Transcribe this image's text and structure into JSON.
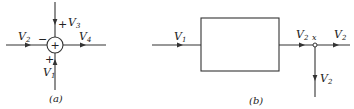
{
  "diagram_a": {
    "caption": "(a)",
    "junction_symbol": "+",
    "inputs": [
      {
        "name": "V",
        "sub": "2",
        "sign": "−",
        "direction": "from-left"
      },
      {
        "name": "V",
        "sub": "3",
        "sign": "+",
        "direction": "from-top"
      },
      {
        "name": "V",
        "sub": "1",
        "sign": "+",
        "direction": "from-bottom"
      }
    ],
    "output": {
      "name": "V",
      "sub": "4",
      "direction": "to-right"
    }
  },
  "diagram_b": {
    "caption": "(b)",
    "input": {
      "name": "V",
      "sub": "1"
    },
    "block_label": "",
    "output": {
      "name": "V",
      "sub": "2"
    },
    "takeoff_point": "x",
    "branches": [
      {
        "name": "V",
        "sub": "2",
        "direction": "right"
      },
      {
        "name": "V",
        "sub": "2",
        "direction": "down"
      }
    ]
  },
  "colors": {
    "line": "#333333",
    "background": "#ffffff"
  }
}
